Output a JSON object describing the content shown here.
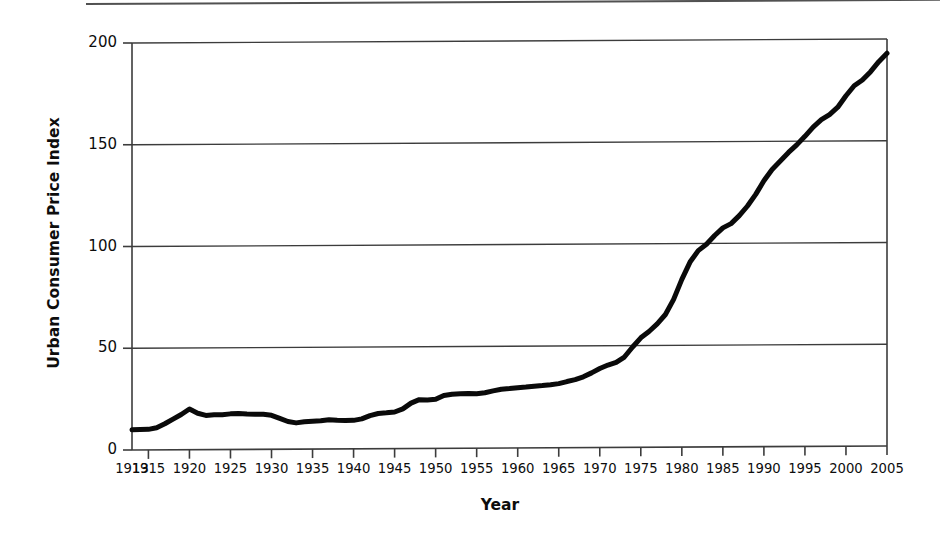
{
  "chart_data": {
    "type": "line",
    "title": "",
    "subtitle": "",
    "xlabel": "Year",
    "ylabel": "Urban Consumer Price Index",
    "xlim": [
      1913,
      2005
    ],
    "ylim": [
      0,
      200
    ],
    "grid": "horizontal",
    "legend": "none",
    "line_color": "#0a0a0a",
    "axis_color": "#3c3c3c",
    "background": "#ffffff",
    "y_ticks": [
      0,
      50,
      100,
      150,
      200
    ],
    "y_tick_labels": [
      "0",
      "50",
      "100",
      "150",
      "200"
    ],
    "x_ticks": [
      1913,
      1915,
      1920,
      1925,
      1930,
      1935,
      1940,
      1945,
      1950,
      1955,
      1960,
      1965,
      1970,
      1975,
      1980,
      1985,
      1990,
      1995,
      2000,
      2005
    ],
    "x_tick_labels": [
      "1913",
      "1915",
      "1920",
      "1925",
      "1930",
      "1935",
      "1940",
      "1945",
      "1950",
      "1955",
      "1960",
      "1965",
      "1970",
      "1975",
      "1980",
      "1985",
      "1990",
      "1995",
      "2000",
      "2005"
    ],
    "series": [
      {
        "name": "Urban Consumer Price Index",
        "x": [
          1913,
          1914,
          1915,
          1916,
          1917,
          1918,
          1919,
          1920,
          1921,
          1922,
          1923,
          1924,
          1925,
          1926,
          1927,
          1928,
          1929,
          1930,
          1931,
          1932,
          1933,
          1934,
          1935,
          1936,
          1937,
          1938,
          1939,
          1940,
          1941,
          1942,
          1943,
          1944,
          1945,
          1946,
          1947,
          1948,
          1949,
          1950,
          1951,
          1952,
          1953,
          1954,
          1955,
          1956,
          1957,
          1958,
          1959,
          1960,
          1961,
          1962,
          1963,
          1964,
          1965,
          1966,
          1967,
          1968,
          1969,
          1970,
          1971,
          1972,
          1973,
          1974,
          1975,
          1976,
          1977,
          1978,
          1979,
          1980,
          1981,
          1982,
          1983,
          1984,
          1985,
          1986,
          1987,
          1988,
          1989,
          1990,
          1991,
          1992,
          1993,
          1994,
          1995,
          1996,
          1997,
          1998,
          1999,
          2000,
          2001,
          2002,
          2003,
          2004,
          2005
        ],
        "values": [
          9.9,
          10.0,
          10.1,
          10.9,
          12.8,
          15.1,
          17.3,
          20.0,
          17.9,
          16.8,
          17.1,
          17.1,
          17.5,
          17.7,
          17.4,
          17.2,
          17.2,
          16.7,
          15.2,
          13.6,
          12.9,
          13.4,
          13.7,
          13.9,
          14.4,
          14.1,
          13.9,
          14.0,
          14.7,
          16.3,
          17.3,
          17.6,
          18.0,
          19.5,
          22.3,
          24.0,
          23.8,
          24.1,
          26.0,
          26.6,
          26.8,
          26.9,
          26.8,
          27.2,
          28.1,
          28.9,
          29.2,
          29.6,
          29.9,
          30.3,
          30.6,
          31.0,
          31.5,
          32.5,
          33.4,
          34.8,
          36.7,
          38.8,
          40.5,
          41.8,
          44.4,
          49.3,
          53.8,
          56.9,
          60.6,
          65.2,
          72.6,
          82.4,
          90.9,
          96.5,
          99.6,
          103.9,
          107.6,
          109.7,
          113.6,
          118.3,
          124.0,
          130.7,
          136.2,
          140.3,
          144.5,
          148.2,
          152.4,
          156.9,
          160.5,
          163.0,
          166.6,
          172.2,
          177.1,
          179.9,
          184.0,
          188.9,
          193.0
        ],
        "color": "#0a0a0a",
        "line_width": 5
      }
    ],
    "annotations": []
  },
  "axes": {
    "y_title": "Urban Consumer Price Index",
    "x_title": "Year"
  }
}
